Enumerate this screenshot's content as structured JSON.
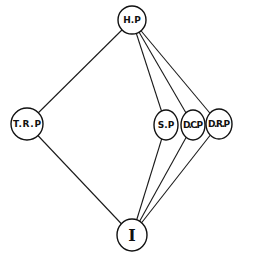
{
  "diagram": {
    "type": "hasse-diagram",
    "nodes": [
      {
        "id": "HP",
        "label": "H.P",
        "x": 132,
        "y": 20,
        "rx": 14,
        "ry": 14
      },
      {
        "id": "TRP",
        "label": "T.R.P",
        "x": 27,
        "y": 124,
        "rx": 16,
        "ry": 16
      },
      {
        "id": "SP",
        "label": "S.P",
        "x": 166,
        "y": 125,
        "rx": 12,
        "ry": 15
      },
      {
        "id": "DCP",
        "label": "D.C.P",
        "x": 193,
        "y": 125,
        "rx": 12,
        "ry": 15
      },
      {
        "id": "DRP",
        "label": "D.R.P",
        "x": 219,
        "y": 124,
        "rx": 13,
        "ry": 15
      },
      {
        "id": "I",
        "label": "I",
        "x": 132,
        "y": 235,
        "rx": 15,
        "ry": 16
      }
    ],
    "edges": [
      {
        "from": "HP",
        "to": "TRP"
      },
      {
        "from": "HP",
        "to": "SP"
      },
      {
        "from": "HP",
        "to": "DCP"
      },
      {
        "from": "HP",
        "to": "DRP"
      },
      {
        "from": "TRP",
        "to": "I"
      },
      {
        "from": "SP",
        "to": "I"
      },
      {
        "from": "DCP",
        "to": "I"
      },
      {
        "from": "DRP",
        "to": "I"
      }
    ]
  }
}
